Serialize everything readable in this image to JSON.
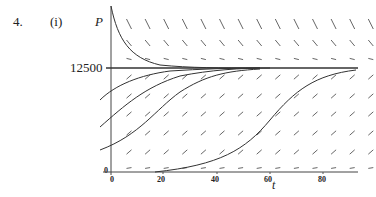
{
  "problem": {
    "number": "4.",
    "part": "(i)"
  },
  "chart_data": {
    "type": "line",
    "xlabel": "t",
    "ylabel": "P",
    "xlim": [
      0,
      95
    ],
    "x_ticks": [
      0,
      20,
      40,
      60,
      80
    ],
    "y_ticks": [
      0,
      12500
    ],
    "equilibrium": 12500,
    "grid": false,
    "series": [
      {
        "name": "curve above equilibrium",
        "x": [
          0,
          5,
          10,
          15,
          20,
          30,
          40
        ],
        "values": [
          23000,
          17500,
          14500,
          13200,
          12750,
          12550,
          12500
        ]
      },
      {
        "name": "curve from P0≈9000",
        "x": [
          -2,
          0,
          10,
          20,
          30,
          40
        ],
        "values": [
          8500,
          9300,
          11300,
          12200,
          12450,
          12500
        ]
      },
      {
        "name": "curve from P0≈4500",
        "x": [
          -2,
          0,
          10,
          20,
          30,
          40
        ],
        "values": [
          3800,
          4700,
          8000,
          10800,
          12000,
          12400
        ]
      },
      {
        "name": "curve from P0≈1200",
        "x": [
          0,
          10,
          20,
          30,
          40,
          50,
          60
        ],
        "values": [
          1200,
          2700,
          5500,
          8800,
          11300,
          12300,
          12500
        ]
      },
      {
        "name": "curve from P0≈50",
        "x": [
          15,
          30,
          45,
          55,
          65,
          75,
          90
        ],
        "values": [
          50,
          300,
          1500,
          4000,
          8000,
          11000,
          12300
        ]
      }
    ]
  },
  "labels": {
    "p_axis": "P",
    "t_axis": "t",
    "eq_value": "12500",
    "origin": "0",
    "ticks": [
      "0",
      "20",
      "40",
      "60",
      "80"
    ]
  }
}
